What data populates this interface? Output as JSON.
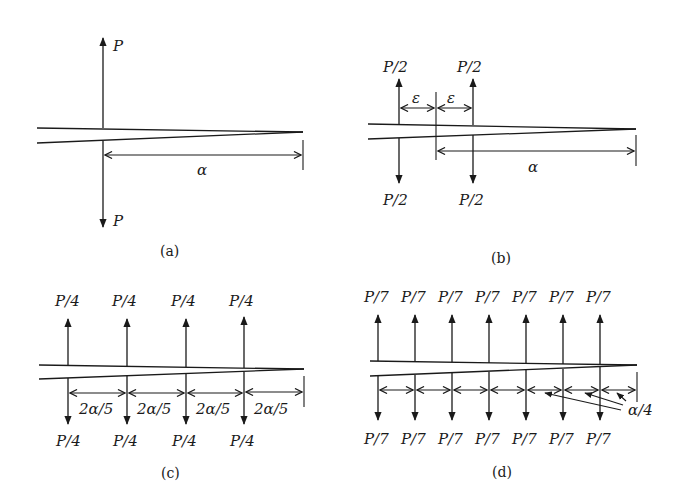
{
  "figure": {
    "panels": [
      {
        "id": "a",
        "caption": "(a)",
        "forces": [
          {
            "label_top": "P",
            "label_bottom": "P"
          }
        ],
        "dimensions": [
          {
            "label": "α"
          }
        ]
      },
      {
        "id": "b",
        "caption": "(b)",
        "forces": [
          {
            "label_top": "P/2",
            "label_bottom": "P/2"
          },
          {
            "label_top": "P/2",
            "label_bottom": "P/2"
          }
        ],
        "dimensions": [
          {
            "label": "ε"
          },
          {
            "label": "ε"
          },
          {
            "label": "α"
          }
        ]
      },
      {
        "id": "c",
        "caption": "(c)",
        "forces": [
          {
            "label_top": "P/4",
            "label_bottom": "P/4"
          },
          {
            "label_top": "P/4",
            "label_bottom": "P/4"
          },
          {
            "label_top": "P/4",
            "label_bottom": "P/4"
          },
          {
            "label_top": "P/4",
            "label_bottom": "P/4"
          }
        ],
        "dimensions": [
          {
            "label": "2α/5"
          },
          {
            "label": "2α/5"
          },
          {
            "label": "2α/5"
          },
          {
            "label": "2α/5"
          }
        ]
      },
      {
        "id": "d",
        "caption": "(d)",
        "forces": [
          {
            "label_top": "P/7",
            "label_bottom": "P/7"
          },
          {
            "label_top": "P/7",
            "label_bottom": "P/7"
          },
          {
            "label_top": "P/7",
            "label_bottom": "P/7"
          },
          {
            "label_top": "P/7",
            "label_bottom": "P/7"
          },
          {
            "label_top": "P/7",
            "label_bottom": "P/7"
          },
          {
            "label_top": "P/7",
            "label_bottom": "P/7"
          },
          {
            "label_top": "P/7",
            "label_bottom": "P/7"
          }
        ],
        "dimensions": [
          {
            "label": "α/4"
          }
        ]
      }
    ]
  }
}
